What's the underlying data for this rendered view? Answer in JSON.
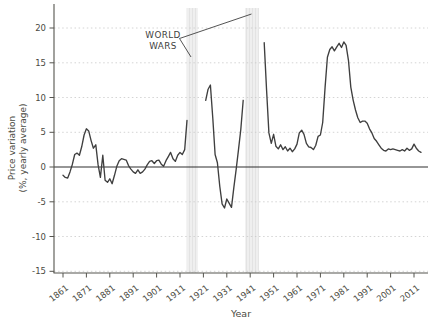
{
  "figure": {
    "x_axis_title": "Year",
    "y_axis_title_line1": "Price variation",
    "y_axis_title_line2": "(%, yearly average)",
    "annotation_line1": "WORLD",
    "annotation_line2": "WARS"
  },
  "chart_data": {
    "type": "line",
    "title": "",
    "xlabel": "Year",
    "ylabel": "Price variation (%, yearly average)",
    "annotation": "WORLD WARS",
    "legend": "none",
    "grid": "horizontal-dashed",
    "xlim": [
      1857,
      2017
    ],
    "ylim": [
      -16,
      21
    ],
    "yticks": [
      20,
      15,
      10,
      5,
      0,
      -5,
      -10,
      -15
    ],
    "xticks": [
      1861,
      1871,
      1881,
      1891,
      1901,
      1911,
      1921,
      1931,
      1941,
      1951,
      1961,
      1971,
      1981,
      1991,
      2001,
      2011
    ],
    "war_bands": [
      {
        "label": "World War I",
        "from": 1913.8,
        "to": 1918.6
      },
      {
        "label": "World War II",
        "from": 1938.8,
        "to": 1944.7
      }
    ],
    "colors": {
      "line": "#3f3f3f",
      "grid": "#c9c9c9",
      "zero_line": "#2e2e2e",
      "band": "#efefef",
      "band_stripe": "#e3e3e3",
      "axis": "#55544e",
      "text": "#4a4a42"
    },
    "series": [
      {
        "name": "Price variation (%, yearly average)",
        "segments": [
          [
            [
              1861,
              -1.2
            ],
            [
              1862,
              -1.5
            ],
            [
              1863,
              -1.6
            ],
            [
              1864,
              -0.7
            ],
            [
              1865,
              0.4
            ],
            [
              1866,
              1.8
            ],
            [
              1867,
              2.0
            ],
            [
              1868,
              1.7
            ],
            [
              1869,
              2.9
            ],
            [
              1870,
              4.6
            ],
            [
              1871,
              5.5
            ],
            [
              1872,
              5.2
            ],
            [
              1873,
              3.8
            ],
            [
              1874,
              2.7
            ],
            [
              1875,
              3.2
            ],
            [
              1876,
              0.3
            ],
            [
              1877,
              -1.5
            ],
            [
              1878,
              1.7
            ],
            [
              1879,
              -1.9
            ],
            [
              1880,
              -2.2
            ],
            [
              1881,
              -1.7
            ],
            [
              1882,
              -2.4
            ],
            [
              1883,
              -1.2
            ],
            [
              1884,
              0.1
            ],
            [
              1885,
              0.9
            ],
            [
              1886,
              1.2
            ],
            [
              1887,
              1.1
            ],
            [
              1888,
              1.0
            ],
            [
              1889,
              0.2
            ],
            [
              1890,
              -0.3
            ],
            [
              1891,
              -0.7
            ],
            [
              1892,
              -0.9
            ],
            [
              1893,
              -0.4
            ],
            [
              1894,
              -0.9
            ],
            [
              1895,
              -0.7
            ],
            [
              1896,
              -0.3
            ],
            [
              1897,
              0.3
            ],
            [
              1898,
              0.8
            ],
            [
              1899,
              0.9
            ],
            [
              1900,
              0.5
            ],
            [
              1901,
              0.9
            ],
            [
              1902,
              1.0
            ],
            [
              1903,
              0.4
            ],
            [
              1904,
              0.1
            ],
            [
              1905,
              0.9
            ],
            [
              1906,
              1.5
            ],
            [
              1907,
              2.1
            ],
            [
              1908,
              1.2
            ],
            [
              1909,
              0.8
            ],
            [
              1910,
              1.7
            ],
            [
              1911,
              2.1
            ],
            [
              1912,
              1.8
            ],
            [
              1913,
              2.5
            ],
            [
              1914,
              6.7
            ]
          ],
          [
            [
              1922,
              9.6
            ],
            [
              1923,
              11.2
            ],
            [
              1924,
              11.8
            ],
            [
              1925,
              7.0
            ],
            [
              1926,
              1.8
            ],
            [
              1927,
              0.6
            ],
            [
              1928,
              -2.8
            ],
            [
              1929,
              -5.3
            ],
            [
              1930,
              -5.9
            ],
            [
              1931,
              -4.6
            ],
            [
              1932,
              -5.2
            ],
            [
              1933,
              -5.8
            ],
            [
              1934,
              -3.0
            ],
            [
              1935,
              -0.3
            ],
            [
              1936,
              2.5
            ],
            [
              1937,
              5.4
            ],
            [
              1938,
              9.6
            ]
          ],
          [
            [
              1947,
              17.9
            ],
            [
              1948,
              11.0
            ],
            [
              1949,
              4.9
            ],
            [
              1950,
              3.4
            ],
            [
              1951,
              4.7
            ],
            [
              1952,
              3.0
            ],
            [
              1953,
              2.6
            ],
            [
              1954,
              3.2
            ],
            [
              1955,
              2.5
            ],
            [
              1956,
              2.9
            ],
            [
              1957,
              2.3
            ],
            [
              1958,
              2.7
            ],
            [
              1959,
              2.2
            ],
            [
              1960,
              2.6
            ],
            [
              1961,
              3.3
            ],
            [
              1962,
              4.9
            ],
            [
              1963,
              5.3
            ],
            [
              1964,
              4.7
            ],
            [
              1965,
              3.4
            ],
            [
              1966,
              2.9
            ],
            [
              1967,
              2.8
            ],
            [
              1968,
              2.5
            ],
            [
              1969,
              3.1
            ],
            [
              1970,
              4.4
            ],
            [
              1971,
              4.6
            ],
            [
              1972,
              6.4
            ],
            [
              1973,
              11.5
            ],
            [
              1974,
              15.8
            ],
            [
              1975,
              16.9
            ],
            [
              1976,
              17.3
            ],
            [
              1977,
              16.7
            ],
            [
              1978,
              17.3
            ],
            [
              1979,
              17.8
            ],
            [
              1980,
              17.2
            ],
            [
              1981,
              18.0
            ],
            [
              1982,
              17.5
            ],
            [
              1983,
              15.3
            ],
            [
              1984,
              11.5
            ],
            [
              1985,
              9.6
            ],
            [
              1986,
              8.2
            ],
            [
              1987,
              7.1
            ],
            [
              1988,
              6.4
            ],
            [
              1989,
              6.6
            ],
            [
              1990,
              6.6
            ],
            [
              1991,
              6.3
            ],
            [
              1992,
              5.5
            ],
            [
              1993,
              4.9
            ],
            [
              1994,
              4.1
            ],
            [
              1995,
              3.7
            ],
            [
              1996,
              3.2
            ],
            [
              1997,
              2.7
            ],
            [
              1998,
              2.4
            ],
            [
              1999,
              2.3
            ],
            [
              2000,
              2.6
            ],
            [
              2001,
              2.5
            ],
            [
              2002,
              2.6
            ],
            [
              2003,
              2.5
            ],
            [
              2004,
              2.4
            ],
            [
              2005,
              2.3
            ],
            [
              2006,
              2.5
            ],
            [
              2007,
              2.3
            ],
            [
              2008,
              2.7
            ],
            [
              2009,
              2.4
            ],
            [
              2010,
              2.6
            ],
            [
              2011,
              3.3
            ],
            [
              2012,
              2.7
            ],
            [
              2013,
              2.3
            ],
            [
              2014,
              2.1
            ]
          ]
        ]
      }
    ]
  }
}
